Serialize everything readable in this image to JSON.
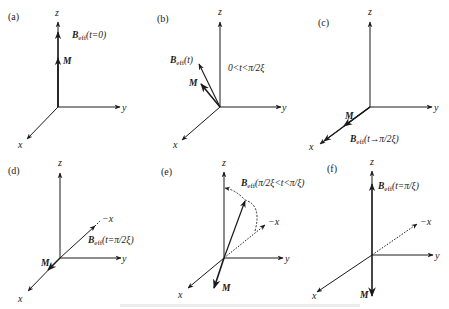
{
  "figure": {
    "panels": [
      {
        "id": "a",
        "label": "(a)",
        "axes": {
          "z": "z",
          "y": "y",
          "x": "x"
        },
        "field_label": {
          "symbol": "B",
          "subscript": "eff",
          "arg": "(t=0)"
        },
        "magnetization_label": "M"
      },
      {
        "id": "b",
        "label": "(b)",
        "axes": {
          "z": "z",
          "y": "y",
          "x": "x"
        },
        "field_label": {
          "symbol": "B",
          "subscript": "eff",
          "arg": "(t)"
        },
        "magnetization_label": "M",
        "condition": "0<t<π/2ξ"
      },
      {
        "id": "c",
        "label": "(c)",
        "axes": {
          "z": "z",
          "y": "y",
          "x": "x"
        },
        "field_label": {
          "symbol": "B",
          "subscript": "eff",
          "arg": "(t→π/2ξ)"
        },
        "magnetization_label": "M"
      },
      {
        "id": "d",
        "label": "(d)",
        "axes": {
          "z": "z",
          "y": "y",
          "x": "x",
          "neg_x": "−x"
        },
        "field_label": {
          "symbol": "B",
          "subscript": "eff",
          "arg": "(t=π/2ξ)"
        },
        "magnetization_label": "M"
      },
      {
        "id": "e",
        "label": "(e)",
        "axes": {
          "z": "z",
          "y": "y",
          "x": "x",
          "neg_x": "−x"
        },
        "field_label": {
          "symbol": "B",
          "subscript": "eff",
          "arg": "(π/2ξ<t<π/ξ)"
        },
        "magnetization_label": "M"
      },
      {
        "id": "f",
        "label": "(f)",
        "axes": {
          "z": "z",
          "y": "y",
          "x": "x",
          "neg_x": "−x"
        },
        "field_label": {
          "symbol": "B",
          "subscript": "eff",
          "arg": "(t=π/ξ)"
        },
        "magnetization_label": "M"
      }
    ],
    "colors": {
      "ink": "#1a1a1a",
      "background": "#ffffff"
    }
  }
}
